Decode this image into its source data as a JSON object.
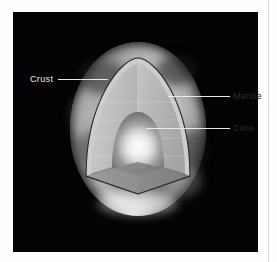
{
  "figure": {
    "background_color": "#030303",
    "page_background": "#fdfdfd"
  },
  "labels": [
    {
      "id": "crust",
      "text": "Crust",
      "side": "left",
      "color": "#e9e9e9"
    },
    {
      "id": "mantle",
      "text": "Mantle",
      "side": "right",
      "color": "#2b2b2b"
    },
    {
      "id": "core",
      "text": "Core",
      "side": "right",
      "color": "#2b2b2b"
    }
  ],
  "layers": {
    "crust": {
      "name": "Crust",
      "fill": "#c9c9c9",
      "stroke": "#2a2a2a"
    },
    "mantle": {
      "name": "Mantle",
      "fill": "#b9b9b9"
    },
    "core": {
      "name": "Core",
      "fill": "#e6e6e6"
    }
  }
}
